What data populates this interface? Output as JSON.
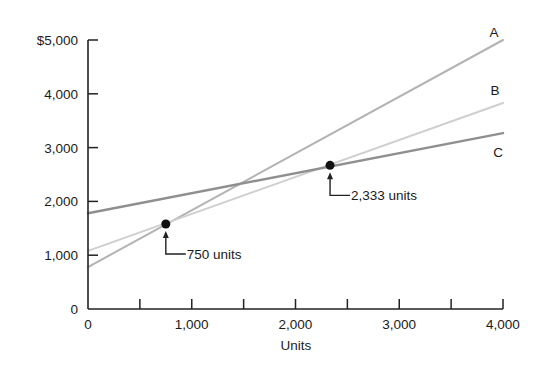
{
  "chart_data": {
    "type": "line",
    "title": "",
    "xlabel": "Units",
    "ylabel": "",
    "xlim": [
      0,
      4000
    ],
    "ylim": [
      0,
      5000
    ],
    "grid": false,
    "legend_position": "inline-right",
    "x_ticks": [
      0,
      500,
      1000,
      1500,
      2000,
      2500,
      3000,
      3500,
      4000
    ],
    "x_tick_labels": [
      {
        "value": 0,
        "label": "0"
      },
      {
        "value": 1000,
        "label": "1,000"
      },
      {
        "value": 2000,
        "label": "2,000"
      },
      {
        "value": 3000,
        "label": "3,000"
      },
      {
        "value": 4000,
        "label": "4,000"
      }
    ],
    "y_tick_labels": [
      {
        "value": 0,
        "label": "0"
      },
      {
        "value": 1000,
        "label": "1,000"
      },
      {
        "value": 2000,
        "label": "2,000"
      },
      {
        "value": 3000,
        "label": "3,000"
      },
      {
        "value": 4000,
        "label": "4,000"
      },
      {
        "value": 5000,
        "label": "$5,000"
      }
    ],
    "series": [
      {
        "name": "A",
        "x": [
          0,
          4000
        ],
        "values": [
          780,
          5000
        ],
        "color": "#b3b3b3",
        "width": 2
      },
      {
        "name": "B",
        "x": [
          0,
          4000
        ],
        "values": [
          1080,
          3830
        ],
        "color": "#cfcfcf",
        "width": 2
      },
      {
        "name": "C",
        "x": [
          0,
          4000
        ],
        "values": [
          1780,
          3270
        ],
        "color": "#8f8f8f",
        "width": 2.4
      }
    ],
    "annotations": [
      {
        "label": "750 units",
        "point": {
          "x": 750,
          "y": 1580
        }
      },
      {
        "label": "2,333 units",
        "point": {
          "x": 2333,
          "y": 2670
        }
      }
    ]
  }
}
